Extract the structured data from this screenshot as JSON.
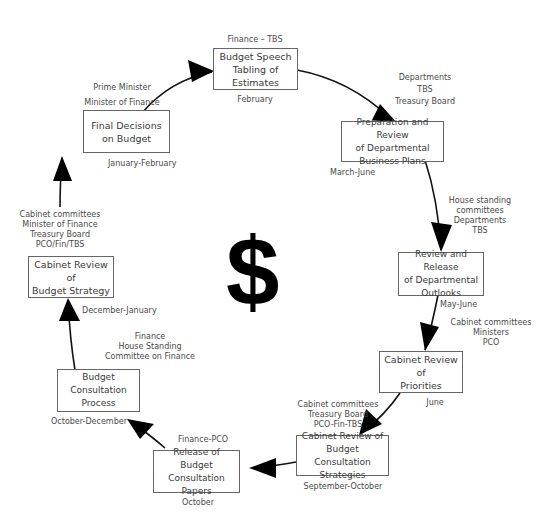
{
  "diagram": {
    "center_symbol": "$",
    "steps": [
      {
        "title": "Budget Speech\nTabling of\nEstimates",
        "actors": "Finance – TBS",
        "timing": "February"
      },
      {
        "title": "Preparation and Review\nof Departmental\nBusiness Plans",
        "actors": "Departments\nTBS\nTreasury Board",
        "timing": "March-June"
      },
      {
        "title": "Review and Release\nof Departmental\nOutlooks",
        "actors": "House standing\ncommittees\nDepartments\nTBS",
        "timing": "May-June"
      },
      {
        "title": "Cabinet Review of\nPriorities",
        "actors": "Cabinet committees\nMinisters\nPCO",
        "timing": "June"
      },
      {
        "title": "Cabinet Review of\nBudget Consultation\nStrategies",
        "actors": "Cabinet committees\nTreasury Board\nPCO-Fin-TBS",
        "timing": "September-October"
      },
      {
        "title": "Release of\nBudget Consultation\nPapers",
        "actors": "Finance-PCO",
        "timing": "October"
      },
      {
        "title": "Budget\nConsultation\nProcess",
        "actors": "Finance\nHouse Standing\nCommittee on Finance",
        "timing": "October-December"
      },
      {
        "title": "Cabinet Review of\nBudget Strategy",
        "actors": "Cabinet committees\nMinister of Finance\nTreasury Board\nPCO/Fin/TBS",
        "timing": "December-January"
      },
      {
        "title": "Final Decisions\non Budget",
        "actors": "Prime Minister\nMinister of Finance",
        "timing": "January-February"
      }
    ]
  }
}
